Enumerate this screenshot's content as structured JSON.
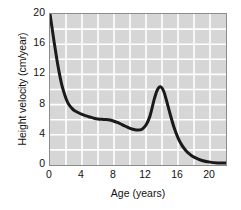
{
  "chart_data": {
    "type": "line",
    "title": "",
    "xlabel": "Age (years)",
    "ylabel": "Height velocity (cm/year)",
    "xlim": [
      0,
      22
    ],
    "ylim": [
      0,
      20
    ],
    "xticks": [
      "0",
      "4",
      "8",
      "12",
      "16",
      "20"
    ],
    "xtick_values": [
      0,
      4,
      8,
      12,
      16,
      20
    ],
    "yticks": [
      "0",
      "4",
      "8",
      "12",
      "16",
      "20"
    ],
    "ytick_values": [
      0,
      4,
      8,
      12,
      16,
      20
    ],
    "grid": true,
    "grid_spacing_x": 2,
    "grid_spacing_y": 2,
    "legend": "none",
    "plot_bgcolor": "#d6d6d6",
    "grid_color": "#ffffff",
    "line_color": "#1a1a1a",
    "line_width": 3,
    "series": [
      {
        "name": "Height velocity",
        "x": [
          0,
          0.25,
          0.5,
          0.75,
          1.0,
          1.25,
          1.5,
          1.75,
          2.0,
          2.25,
          2.5,
          2.75,
          3.0,
          3.5,
          4.0,
          4.5,
          5.0,
          5.5,
          6.0,
          6.5,
          7.0,
          7.5,
          8.0,
          8.5,
          9.0,
          9.5,
          10.0,
          10.5,
          11.0,
          11.5,
          12.0,
          12.5,
          13.0,
          13.4,
          13.8,
          14.2,
          14.6,
          15.0,
          15.5,
          16.0,
          16.5,
          17.0,
          17.5,
          18.0,
          19.0,
          20.0,
          21.0,
          22.0
        ],
        "y": [
          20.0,
          18.2,
          16.4,
          14.7,
          13.1,
          11.7,
          10.5,
          9.6,
          8.8,
          8.2,
          7.8,
          7.5,
          7.25,
          6.95,
          6.7,
          6.5,
          6.35,
          6.2,
          6.1,
          6.05,
          6.02,
          5.95,
          5.8,
          5.6,
          5.35,
          5.1,
          4.85,
          4.7,
          4.62,
          4.75,
          5.3,
          6.5,
          8.6,
          9.9,
          10.35,
          9.8,
          8.4,
          6.8,
          5.0,
          3.6,
          2.6,
          1.9,
          1.4,
          1.05,
          0.6,
          0.38,
          0.28,
          0.25
        ]
      }
    ],
    "annotations": {
      "peak_age": 13.8,
      "peak_value": 10.35,
      "trough_age": 11.0,
      "trough_value": 4.6,
      "start_value": 20.0
    }
  },
  "axes": {
    "x_title": "Age (years)",
    "y_title": "Height velocity (cm/year)",
    "x_ticks": [
      {
        "label": "0",
        "value": 0
      },
      {
        "label": "4",
        "value": 4
      },
      {
        "label": "8",
        "value": 8
      },
      {
        "label": "12",
        "value": 12
      },
      {
        "label": "16",
        "value": 16
      },
      {
        "label": "20",
        "value": 20
      }
    ],
    "y_ticks": [
      {
        "label": "0",
        "value": 0
      },
      {
        "label": "4",
        "value": 4
      },
      {
        "label": "8",
        "value": 8
      },
      {
        "label": "12",
        "value": 12
      },
      {
        "label": "16",
        "value": 16
      },
      {
        "label": "20",
        "value": 20
      }
    ]
  }
}
